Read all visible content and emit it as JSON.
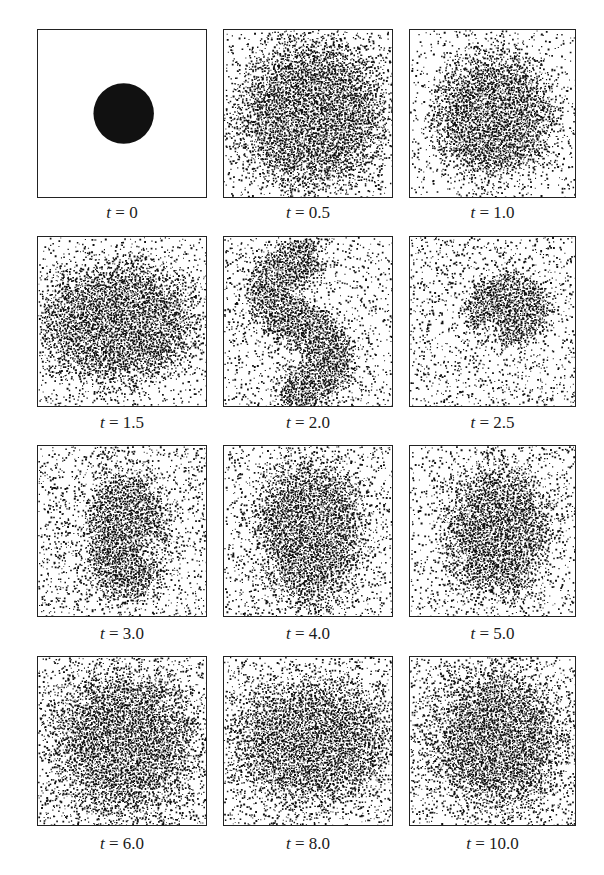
{
  "figure": {
    "panels": [
      {
        "t_label": "t",
        "eq": " = ",
        "value": "0",
        "shape": "disk",
        "cx": 0.51,
        "cy": 0.5,
        "rx": 0.18,
        "ry": 0.18,
        "rot": 0,
        "halo": 0.0,
        "bg": 0.0
      },
      {
        "t_label": "t",
        "eq": " = ",
        "value": "0.5",
        "shape": "blob",
        "cx": 0.52,
        "cy": 0.5,
        "rx": 0.24,
        "ry": 0.24,
        "rot": 0,
        "halo": 0.42,
        "bg": 0.06
      },
      {
        "t_label": "t",
        "eq": " = ",
        "value": "1.0",
        "shape": "blob",
        "cx": 0.5,
        "cy": 0.5,
        "rx": 0.21,
        "ry": 0.22,
        "rot": 0,
        "halo": 0.32,
        "bg": 0.1
      },
      {
        "t_label": "t",
        "eq": " = ",
        "value": "1.5",
        "shape": "blob",
        "cx": 0.47,
        "cy": 0.5,
        "rx": 0.26,
        "ry": 0.2,
        "rot": 0,
        "halo": 0.36,
        "bg": 0.12
      },
      {
        "t_label": "t",
        "eq": " = ",
        "value": "2.0",
        "shape": "s-curve",
        "cx": 0.5,
        "cy": 0.5,
        "rx": 0.2,
        "ry": 0.4,
        "rot": 0,
        "halo": 0.4,
        "bg": 0.16
      },
      {
        "t_label": "t",
        "eq": " = ",
        "value": "2.5",
        "shape": "hook",
        "cx": 0.58,
        "cy": 0.42,
        "rx": 0.2,
        "ry": 0.2,
        "rot": 0,
        "halo": 0.45,
        "bg": 0.18
      },
      {
        "t_label": "t",
        "eq": " = ",
        "value": "3.0",
        "shape": "crescent",
        "cx": 0.52,
        "cy": 0.52,
        "rx": 0.17,
        "ry": 0.27,
        "rot": 0,
        "halo": 0.42,
        "bg": 0.2
      },
      {
        "t_label": "t",
        "eq": " = ",
        "value": "4.0",
        "shape": "blob",
        "cx": 0.5,
        "cy": 0.5,
        "rx": 0.17,
        "ry": 0.23,
        "rot": 0,
        "halo": 0.38,
        "bg": 0.18
      },
      {
        "t_label": "t",
        "eq": " = ",
        "value": "5.0",
        "shape": "blob",
        "cx": 0.52,
        "cy": 0.5,
        "rx": 0.17,
        "ry": 0.22,
        "rot": 0,
        "halo": 0.36,
        "bg": 0.16
      },
      {
        "t_label": "t",
        "eq": " = ",
        "value": "6.0",
        "shape": "blob",
        "cx": 0.5,
        "cy": 0.5,
        "rx": 0.22,
        "ry": 0.22,
        "rot": 0,
        "halo": 0.42,
        "bg": 0.2
      },
      {
        "t_label": "t",
        "eq": " = ",
        "value": "8.0",
        "shape": "blob",
        "cx": 0.5,
        "cy": 0.5,
        "rx": 0.24,
        "ry": 0.18,
        "rot": 0,
        "halo": 0.44,
        "bg": 0.2
      },
      {
        "t_label": "t",
        "eq": " = ",
        "value": "10.0",
        "shape": "blob",
        "cx": 0.52,
        "cy": 0.48,
        "rx": 0.21,
        "ry": 0.21,
        "rot": -20,
        "halo": 0.42,
        "bg": 0.2
      }
    ]
  },
  "colors": {
    "ink": "#111111",
    "border": "#222222",
    "background": "#ffffff"
  }
}
